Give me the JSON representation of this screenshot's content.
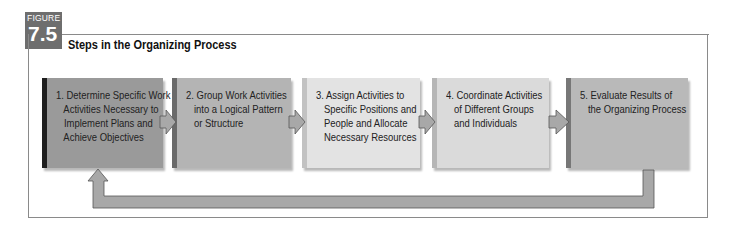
{
  "figure": {
    "label": "FIGURE",
    "number": "7.5",
    "title": "Steps in the Organizing Process"
  },
  "steps": [
    {
      "text": "1. Determine Specific Work\n   Activities Necessary to\n   Implement Plans and\n   Achieve Objectives",
      "color": "#9a9a9a",
      "bevel": "#1e1e1e"
    },
    {
      "text": "2. Group Work Activities\n   into a Logical Pattern\n   or Structure",
      "color": "#b4b4b4",
      "bevel": "#6a6a6a"
    },
    {
      "text": "3. Assign Activities to\n   Specific Positions and\n   People and Allocate\n   Necessary Resources",
      "color": "#e3e3e3",
      "bevel": "#c2c2c2"
    },
    {
      "text": "4. Coordinate Activities\n   of Different Groups\n   and Individuals",
      "color": "#dadada",
      "bevel": "#b6b6b6"
    },
    {
      "text": "5. Evaluate Results of\n   the Organizing Process",
      "color": "#b9b9b9",
      "bevel": "#777777"
    }
  ],
  "feedback_loop": {
    "from_step": 5,
    "to_step": 1,
    "color": "#a6a6a6"
  },
  "colors": {
    "badge": "#6e6e6e",
    "frame": "#8a8a8a",
    "arrow": "#a8a8a8"
  }
}
